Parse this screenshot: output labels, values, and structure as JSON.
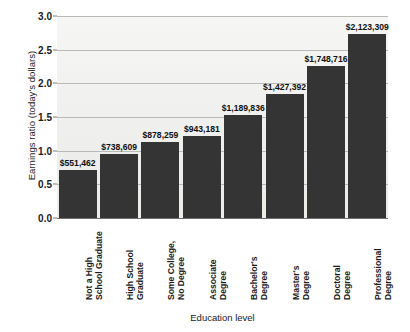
{
  "chart_data": {
    "type": "bar",
    "title": "",
    "xlabel": "Education level",
    "ylabel": "Earnings ratio (today's dollars)",
    "ylim": [
      0.0,
      3.0
    ],
    "grid": true,
    "legend": "none",
    "categories": [
      "Not a High School Graduate",
      "High School Graduate",
      "Some College, No Degree",
      "Associate Degree",
      "Bachelor's Degree",
      "Master's Degree",
      "Doctoral Degree",
      "Professional Degree"
    ],
    "category_lines": [
      [
        "Not a High",
        "School Graduate"
      ],
      [
        "High School",
        "Graduate"
      ],
      [
        "Some College,",
        "No Degree"
      ],
      [
        "Associate",
        "Degree"
      ],
      [
        "Bachelor's",
        "Degree"
      ],
      [
        "Master's",
        "Degree"
      ],
      [
        "Doctoral",
        "Degree"
      ],
      [
        "Professional",
        "Degree"
      ]
    ],
    "values": [
      0.71,
      0.95,
      1.13,
      1.22,
      1.53,
      1.84,
      2.26,
      2.74
    ],
    "data_labels": [
      "$551,462",
      "$738,609",
      "$878,259",
      "$943,181",
      "$1,189,836",
      "$1,427,392",
      "$1,748,716",
      "$2,123,309"
    ],
    "earnings": [
      551462,
      738609,
      878259,
      943181,
      1189836,
      1427392,
      1748716,
      2123309
    ],
    "yticks": [
      "0.0",
      "0.5",
      "1.0",
      "1.5",
      "2.0",
      "2.5",
      "3.0"
    ],
    "ytick_values": [
      0.0,
      0.5,
      1.0,
      1.5,
      2.0,
      2.5,
      3.0
    ],
    "colors": {
      "bar": "#343434",
      "plot_background": "#f2f2f0",
      "gridline": "#b9b9b7",
      "axis": "#6f6f6f",
      "text": "#1b1b1b",
      "page_background": "#ffffff"
    }
  }
}
